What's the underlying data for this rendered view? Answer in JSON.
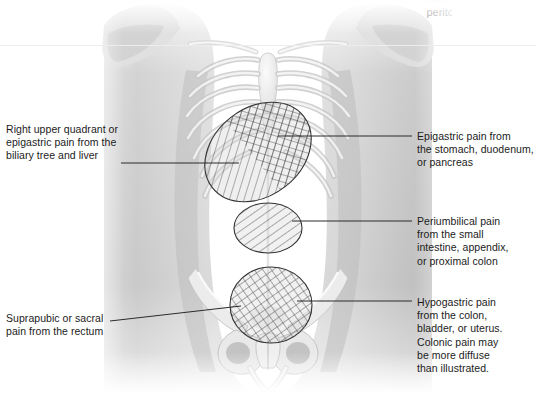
{
  "figure": {
    "title_fragment_cut_off": "muscle of the",
    "title_visible": "peritoneum",
    "background_color": "#ffffff",
    "illustration": "anterior view of human torso with rib cage and pelvis, grayscale anatomical drawing"
  },
  "regions": [
    {
      "id": "epigastric-region",
      "name": "Epigastric / right upper quadrant region",
      "shape": "ellipse",
      "hatch": "crosshatch-and-diagonal",
      "cx": 258,
      "cy": 152,
      "rx": 58,
      "ry": 44,
      "rotate": -38
    },
    {
      "id": "periumbilical-region",
      "name": "Periumbilical region",
      "shape": "ellipse",
      "hatch": "diagonal",
      "cx": 268,
      "cy": 228,
      "rx": 34,
      "ry": 25,
      "rotate": 0
    },
    {
      "id": "hypogastric-region",
      "name": "Hypogastric / suprapubic region",
      "shape": "circle",
      "hatch": "crosshatch",
      "cx": 271,
      "cy": 305,
      "rx": 41,
      "ry": 38,
      "rotate": 0
    }
  ],
  "labels": {
    "right_upper_quadrant": {
      "text": "Right upper quadrant or\nepigastric pain from the\nbiliary tree and liver",
      "x": 6,
      "y": 123,
      "leader": {
        "x1": 121,
        "y1": 163,
        "x2": 239,
        "y2": 163
      }
    },
    "suprapubic": {
      "text": "Suprapubic or sacral\npain from the rectum",
      "x": 6,
      "y": 312,
      "leader": {
        "x1": 110,
        "y1": 321,
        "x2": 241,
        "y2": 306
      }
    },
    "epigastric": {
      "text": "Epigastric pain from\nthe stomach, duodenum,\nor pancreas",
      "x": 417,
      "y": 130,
      "leader": {
        "x1": 278,
        "y1": 136,
        "x2": 412,
        "y2": 136
      }
    },
    "periumbilical": {
      "text": "Periumbilical pain\nfrom the small\nintestine, appendix,\nor proximal colon",
      "x": 417,
      "y": 215,
      "leader": {
        "x1": 292,
        "y1": 221,
        "x2": 412,
        "y2": 221
      }
    },
    "hypogastric": {
      "text": "Hypogastric pain\nfrom the colon,\nbladder, or uterus.\nColonic pain may\nbe more diffuse\nthan illustrated.",
      "x": 417,
      "y": 296,
      "leader": {
        "x1": 297,
        "y1": 301,
        "x2": 412,
        "y2": 301
      }
    }
  },
  "colors": {
    "line": "#2b2b2b",
    "text": "#1b1b1b",
    "skin_light": "#f0f0f0",
    "skin_mid": "#cfcfcf",
    "skin_shadow": "#a8a8a8",
    "bone": "#ededed",
    "bone_edge": "#bdbdbd"
  }
}
